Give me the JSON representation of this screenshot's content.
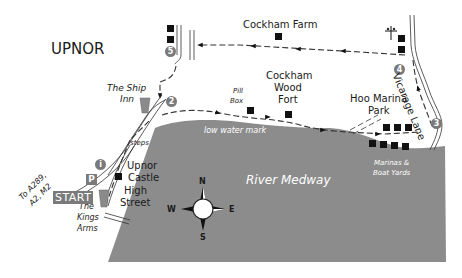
{
  "map": {
    "colors": {
      "river": "#8c8c8c",
      "land": "#ffffff",
      "badge": "#7a7a7a",
      "ink": "#111111"
    },
    "labels": {
      "town": "UPNOR",
      "cockham_farm": "Cockham Farm",
      "ship_inn_1": "The Ship",
      "ship_inn_2": "Inn",
      "pill_box_1": "Pill",
      "pill_box_2": "Box",
      "cockham_wood_1": "Cockham",
      "cockham_wood_2": "Wood",
      "cockham_wood_3": "Fort",
      "hoo_marina_1": "Hoo Marina",
      "hoo_marina_2": "Park",
      "vicarage_lane": "Vicarage Lane",
      "low_water_mark": "low water mark",
      "steps": "steps",
      "to_roads_1": "To A289,",
      "to_roads_2": "A2, M2",
      "upnor_castle_1": "Upnor",
      "upnor_castle_2": "Castle",
      "high_street_1": "High",
      "high_street_2": "Street",
      "kings_arms_1": "The",
      "kings_arms_2": "Kings",
      "kings_arms_3": "Arms",
      "start": "START",
      "parking": "P",
      "info": "i",
      "river": "River Medway",
      "marinas_1": "Marinas &",
      "marinas_2": "Boat Yards"
    },
    "waypoints": [
      "2",
      "3",
      "4",
      "5"
    ],
    "compass": {
      "n": "N",
      "s": "S",
      "e": "E",
      "w": "W"
    },
    "icons": {
      "church": "church-cross-icon",
      "pub": "pint-glass-icon",
      "building": "building-square-icon",
      "compass": "compass-rose-icon"
    }
  }
}
